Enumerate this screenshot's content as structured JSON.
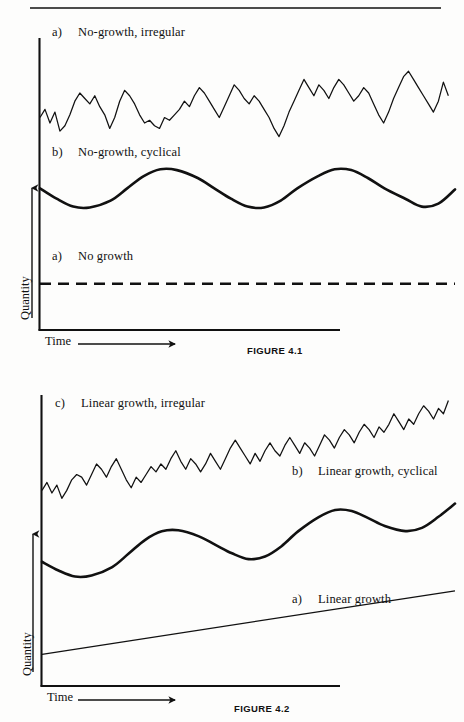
{
  "page": {
    "background": "#fdfdfc",
    "ink": "#111111",
    "top_rule": {
      "x1": 30,
      "y1": 8,
      "x2": 441,
      "y2": 8
    }
  },
  "figures": [
    {
      "id": "figure-4-1",
      "caption": "FIGURE 4.1",
      "caption_pos": {
        "x": 247,
        "y": 345
      },
      "axes": {
        "y_axis_label": "Quantity",
        "x_axis_label": "Time",
        "origin": {
          "x": 39,
          "y": 330
        },
        "y_top": 38,
        "x_right": 340,
        "y_arrow": {
          "x": 32,
          "y_top": 188,
          "y_bottom": 318
        },
        "x_arrow": {
          "x_left": 78,
          "x_right": 175,
          "y": 344
        },
        "y_label_pos": {
          "x": 18,
          "y": 320
        },
        "x_label_pos": {
          "x": 45,
          "y": 337
        }
      },
      "series_labels": [
        {
          "tag": "c)",
          "text": "No-growth, irregular",
          "x": 52,
          "y": 25
        },
        {
          "tag": "b)",
          "text": "No-growth, cyclical",
          "x": 52,
          "y": 145
        },
        {
          "tag": "a)",
          "text": "No growth",
          "x": 52,
          "y": 249
        }
      ]
    },
    {
      "id": "figure-4-2",
      "caption": "FIGURE 4.2",
      "caption_pos": {
        "x": 234,
        "y": 703
      },
      "axes": {
        "y_axis_label": "Quantity",
        "x_axis_label": "Time",
        "origin": {
          "x": 41,
          "y": 686
        },
        "y_top": 395,
        "x_right": 340,
        "y_arrow": {
          "x": 33,
          "y_top": 534,
          "y_bottom": 672
        },
        "x_arrow": {
          "x_left": 78,
          "x_right": 175,
          "y": 700
        },
        "y_label_pos": {
          "x": 20,
          "y": 676
        },
        "x_label_pos": {
          "x": 47,
          "y": 693
        }
      },
      "series_labels": [
        {
          "tag": "c)",
          "text": "Linear growth, irregular",
          "x": 55,
          "y": 396
        },
        {
          "tag": "b)",
          "text": "Linear growth, cyclical",
          "x": 292,
          "y": 464
        },
        {
          "tag": "a)",
          "text": "Linear growth",
          "x": 292,
          "y": 592
        }
      ]
    }
  ],
  "chart_data": [
    {
      "id": "figure-4-1",
      "type": "line",
      "title": "FIGURE 4.1",
      "xlabel": "Time",
      "ylabel": "Quantity",
      "grid": false,
      "legend": "inline-annotations",
      "xlim": [
        0,
        100
      ],
      "ylim": [
        0,
        100
      ],
      "series": [
        {
          "name": "No growth",
          "label": "a)",
          "style": "dashed",
          "description": "Flat horizontal dashed line, constant level, no trend.",
          "x": [
            0,
            100
          ],
          "values": [
            17,
            17
          ]
        },
        {
          "name": "No-growth, cyclical",
          "label": "b)",
          "style": "thick-smooth",
          "description": "Smooth sinusoid around a constant mean, 3 full cycles, no trend.",
          "mean": 52,
          "amplitude": 7,
          "cycles": 3,
          "x": [
            0,
            4,
            8,
            12,
            17,
            21,
            25,
            29,
            33,
            38,
            42,
            46,
            50,
            54,
            58,
            62,
            67,
            71,
            75,
            79,
            83,
            88,
            92,
            96,
            100
          ],
          "values": [
            52.0,
            48.2,
            45.3,
            45.0,
            47.5,
            52.0,
            56.5,
            59.0,
            58.7,
            55.8,
            52.0,
            48.2,
            45.3,
            45.0,
            47.5,
            52.0,
            56.5,
            59.0,
            58.7,
            55.8,
            52.0,
            48.2,
            45.3,
            46.4,
            51.6
          ]
        },
        {
          "name": "No-growth, irregular",
          "label": "c)",
          "style": "thin-jagged",
          "description": "Random-walk-like jagged noise fluctuating around a constant mean, no trend.",
          "mean": 80,
          "x": [
            0,
            1.2,
            2.4,
            3.6,
            4.8,
            6,
            7.2,
            8.4,
            9.6,
            10.8,
            12,
            13.2,
            14.4,
            15.6,
            16.8,
            18,
            19.2,
            20.4,
            21.6,
            22.8,
            24,
            25.2,
            26.4,
            27.6,
            28.8,
            30,
            31.2,
            32.4,
            33.6,
            34.8,
            36,
            37.2,
            38.4,
            39.6,
            40.8,
            42,
            43.2,
            44.4,
            45.6,
            46.8,
            48,
            49.2,
            50.4,
            51.6,
            52.8,
            54,
            55.2,
            56.4,
            57.6,
            58.8,
            60,
            61.2,
            62.4,
            63.6,
            64.8,
            66,
            67.2,
            68.4,
            69.6,
            70.8,
            72,
            73.2,
            74.4,
            75.6,
            76.8,
            78,
            79.2,
            80.4,
            81.6,
            82.8,
            84,
            85.2,
            86.4,
            87.6,
            88.8,
            90,
            91.2,
            92.4,
            93.6,
            94.8,
            96,
            97.2,
            98.4,
            100
          ],
          "values": [
            78,
            81,
            76,
            80,
            73,
            75,
            79,
            84,
            87,
            85,
            83,
            86,
            82,
            79,
            74,
            78,
            84,
            88,
            86,
            83,
            79,
            76,
            77,
            75,
            74,
            78,
            77,
            79,
            81,
            84,
            82,
            86,
            89,
            87,
            84,
            81,
            78,
            82,
            86,
            90,
            88,
            85,
            83,
            86,
            84,
            81,
            78,
            74,
            71,
            75,
            80,
            84,
            88,
            92,
            89,
            86,
            90,
            88,
            85,
            89,
            92,
            90,
            87,
            84,
            86,
            89,
            87,
            83,
            79,
            76,
            80,
            85,
            89,
            93,
            95,
            92,
            89,
            86,
            83,
            80,
            84,
            91,
            86
          ]
        }
      ]
    },
    {
      "id": "figure-4-2",
      "type": "line",
      "title": "FIGURE 4.2",
      "xlabel": "Time",
      "ylabel": "Quantity",
      "grid": false,
      "legend": "inline-annotations",
      "xlim": [
        0,
        100
      ],
      "ylim": [
        0,
        100
      ],
      "series": [
        {
          "name": "Linear growth",
          "label": "a)",
          "style": "thin-straight",
          "description": "Straight line with constant positive slope rising from left to right.",
          "x": [
            0,
            100
          ],
          "values": [
            12,
            36
          ]
        },
        {
          "name": "Linear growth, cyclical",
          "label": "b)",
          "style": "thick-smooth",
          "description": "Sinusoidal oscillation superimposed on a rising linear trend, 3 cycles.",
          "trend_start": 47,
          "trend_end": 68,
          "amplitude": 7,
          "cycles": 3,
          "x": [
            0,
            4,
            8,
            12,
            17,
            21,
            25,
            29,
            33,
            38,
            42,
            46,
            50,
            54,
            58,
            62,
            67,
            71,
            75,
            79,
            83,
            88,
            92,
            96,
            100
          ],
          "values": [
            47.0,
            43.7,
            41.4,
            41.8,
            45.0,
            50.1,
            55.3,
            58.5,
            58.9,
            56.6,
            53.4,
            50.2,
            48.0,
            49.0,
            52.9,
            58.5,
            63.9,
            66.6,
            66.2,
            63.5,
            60.5,
            58.6,
            59.8,
            64.0,
            69.0
          ]
        },
        {
          "name": "Linear growth, irregular",
          "label": "c)",
          "style": "thin-jagged",
          "description": "Jagged random noise superimposed on a rising linear trend.",
          "trend_start": 76,
          "trend_end": 97,
          "x": [
            0,
            1.2,
            2.4,
            3.6,
            4.8,
            6,
            7.2,
            8.4,
            9.6,
            10.8,
            12,
            13.2,
            14.4,
            15.6,
            16.8,
            18,
            19.2,
            20.4,
            21.6,
            22.8,
            24,
            25.2,
            26.4,
            27.6,
            28.8,
            30,
            31.2,
            32.4,
            33.6,
            34.8,
            36,
            37.2,
            38.4,
            39.6,
            40.8,
            42,
            43.2,
            44.4,
            45.6,
            46.8,
            48,
            49.2,
            50.4,
            51.6,
            52.8,
            54,
            55.2,
            56.4,
            57.6,
            58.8,
            60,
            61.2,
            62.4,
            63.6,
            64.8,
            66,
            67.2,
            68.4,
            69.6,
            70.8,
            72,
            73.2,
            74.4,
            75.6,
            76.8,
            78,
            79.2,
            80.4,
            81.6,
            82.8,
            84,
            85.2,
            86.4,
            87.6,
            88.8,
            90,
            91.2,
            92.4,
            93.6,
            94.8,
            96,
            97.2,
            98.4,
            100
          ],
          "values": [
            74,
            77,
            73,
            76,
            71,
            74,
            78,
            80,
            79,
            76,
            80,
            84,
            82,
            79,
            83,
            86,
            82,
            78,
            75,
            79,
            77,
            80,
            83,
            81,
            84,
            82,
            86,
            89,
            85,
            82,
            86,
            84,
            81,
            84,
            88,
            85,
            82,
            86,
            90,
            93,
            90,
            87,
            84,
            88,
            85,
            89,
            92,
            89,
            87,
            91,
            94,
            91,
            88,
            92,
            90,
            87,
            91,
            95,
            93,
            90,
            94,
            97,
            95,
            92,
            96,
            99,
            97,
            94,
            98,
            96,
            99,
            103,
            100,
            97,
            101,
            99,
            103,
            106,
            104,
            101,
            105,
            103,
            108
          ]
        }
      ]
    }
  ]
}
